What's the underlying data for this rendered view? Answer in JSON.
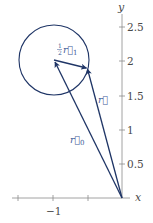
{
  "colors": {
    "vector": "#1f3566",
    "circle": "#1f3566",
    "label": "#3d5b99",
    "axis": "#8c8c8c",
    "tick_text": "#4a4a4a",
    "background": "#ffffff"
  },
  "axes": {
    "x_label": "x",
    "y_label": "y",
    "x_ticks": [
      {
        "value": -1.5,
        "label": ""
      },
      {
        "value": -1,
        "label": "−1"
      },
      {
        "value": -0.5,
        "label": ""
      }
    ],
    "y_ticks": [
      {
        "value": 0.5,
        "label": "0.5"
      },
      {
        "value": 1,
        "label": "1"
      },
      {
        "value": 1.5,
        "label": "1.5"
      },
      {
        "value": 2,
        "label": "2"
      },
      {
        "value": 2.5,
        "label": "2.5"
      }
    ]
  },
  "shapes": {
    "circle": {
      "center": [
        -1,
        2
      ],
      "radius": 0.5
    }
  },
  "vectors": [
    {
      "name": "r0",
      "from": [
        0,
        0
      ],
      "to": [
        -1,
        2
      ],
      "label": "r⃗",
      "subscript": "0"
    },
    {
      "name": "r",
      "from": [
        0,
        0
      ],
      "to": [
        -0.5,
        1.9
      ],
      "label": "r⃗",
      "subscript": ""
    },
    {
      "name": "half-r1",
      "from": [
        -1,
        2
      ],
      "to": [
        -0.5,
        1.9
      ],
      "label": "r⃗",
      "prefix_num": "1",
      "prefix_den": "2",
      "subscript": "1"
    }
  ],
  "labels": {
    "half_r1": {
      "frac_num": "1",
      "frac_den": "2",
      "symbol": "r⃗",
      "sub": "1"
    },
    "r": {
      "symbol": "r⃗"
    },
    "r0": {
      "symbol": "r⃗",
      "sub": "0"
    }
  }
}
